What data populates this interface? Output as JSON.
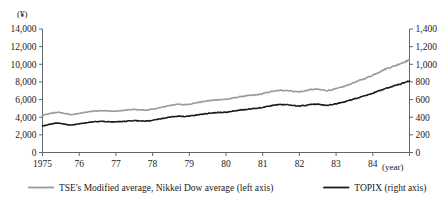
{
  "chart_data": {
    "type": "line",
    "title": "",
    "xlabel": "(year)",
    "ylabel_left": "(¥)",
    "ylabel_right": "",
    "grid": false,
    "legend_position": "bottom",
    "x": [
      1975.0,
      1975.25,
      1975.5,
      1975.75,
      1976.0,
      1976.25,
      1976.5,
      1976.75,
      1977.0,
      1977.25,
      1977.5,
      1977.75,
      1978.0,
      1978.25,
      1978.5,
      1978.75,
      1979.0,
      1979.25,
      1979.5,
      1979.75,
      1980.0,
      1980.25,
      1980.5,
      1980.75,
      1981.0,
      1981.25,
      1981.5,
      1981.75,
      1982.0,
      1982.25,
      1982.5,
      1982.75,
      1983.0,
      1983.25,
      1983.5,
      1983.75,
      1984.0,
      1984.25,
      1984.5,
      1984.75,
      1985.0
    ],
    "xlim": [
      1975.0,
      1985.0
    ],
    "x_ticks": [
      1975,
      1976,
      1977,
      1978,
      1979,
      1980,
      1981,
      1982,
      1983,
      1984,
      1985
    ],
    "x_tick_labels": [
      "1975",
      "76",
      "77",
      "78",
      "79",
      "80",
      "81",
      "82",
      "83",
      "84",
      ""
    ],
    "ylim_left": [
      0,
      14000
    ],
    "y_ticks_left": [
      0,
      2000,
      4000,
      6000,
      8000,
      10000,
      12000,
      14000
    ],
    "y_tick_labels_left": [
      "0",
      "2,000",
      "4,000",
      "6,000",
      "8,000",
      "10,000",
      "12,000",
      "14,000"
    ],
    "ylim_right": [
      0,
      1400
    ],
    "y_ticks_right": [
      0,
      200,
      400,
      600,
      800,
      1000,
      1200,
      1400
    ],
    "y_tick_labels_right": [
      "0",
      "200",
      "400",
      "600",
      "800",
      "1,000",
      "1,200",
      "1,400"
    ],
    "series": [
      {
        "name": "TSE's Modified average, Nikkei Dow average",
        "axis": "left",
        "color": "#9a9a9a",
        "width": 1.6,
        "values": [
          4200,
          4350,
          4500,
          4420,
          4350,
          4600,
          4750,
          4700,
          4650,
          4800,
          4900,
          4820,
          4900,
          5100,
          5300,
          5400,
          5500,
          5700,
          5900,
          6050,
          6100,
          6250,
          6400,
          6500,
          6600,
          6800,
          6950,
          7050,
          6900,
          7100,
          7250,
          7050,
          7200,
          7600,
          8000,
          8350,
          8700,
          9100,
          9500,
          9950,
          10450
        ],
        "raw_points": [
          [
            1975.0,
            4220
          ],
          [
            1975.1,
            4310
          ],
          [
            1975.2,
            4400
          ],
          [
            1975.3,
            4500
          ],
          [
            1975.4,
            4560
          ],
          [
            1975.5,
            4520
          ],
          [
            1975.6,
            4430
          ],
          [
            1975.7,
            4340
          ],
          [
            1975.8,
            4300
          ],
          [
            1975.9,
            4360
          ],
          [
            1976.0,
            4420
          ],
          [
            1976.15,
            4540
          ],
          [
            1976.3,
            4650
          ],
          [
            1976.45,
            4720
          ],
          [
            1976.6,
            4760
          ],
          [
            1976.75,
            4720
          ],
          [
            1976.9,
            4680
          ],
          [
            1977.05,
            4700
          ],
          [
            1977.2,
            4760
          ],
          [
            1977.35,
            4830
          ],
          [
            1977.5,
            4880
          ],
          [
            1977.65,
            4840
          ],
          [
            1977.8,
            4800
          ],
          [
            1977.95,
            4870
          ],
          [
            1978.1,
            4980
          ],
          [
            1978.25,
            5120
          ],
          [
            1978.4,
            5280
          ],
          [
            1978.55,
            5400
          ],
          [
            1978.7,
            5460
          ],
          [
            1978.85,
            5420
          ],
          [
            1979.0,
            5480
          ],
          [
            1979.15,
            5600
          ],
          [
            1979.3,
            5720
          ],
          [
            1979.45,
            5820
          ],
          [
            1979.6,
            5900
          ],
          [
            1979.75,
            5960
          ],
          [
            1979.9,
            6020
          ],
          [
            1980.05,
            6040
          ],
          [
            1980.2,
            6180
          ],
          [
            1980.35,
            6300
          ],
          [
            1980.5,
            6400
          ],
          [
            1980.65,
            6460
          ],
          [
            1980.8,
            6520
          ],
          [
            1980.95,
            6620
          ],
          [
            1981.1,
            6780
          ],
          [
            1981.25,
            6920
          ],
          [
            1981.4,
            7000
          ],
          [
            1981.55,
            7060
          ],
          [
            1981.7,
            7020
          ],
          [
            1981.85,
            6930
          ],
          [
            1982.0,
            6880
          ],
          [
            1982.15,
            6980
          ],
          [
            1982.3,
            7120
          ],
          [
            1982.45,
            7180
          ],
          [
            1982.6,
            7100
          ],
          [
            1982.75,
            7020
          ],
          [
            1982.9,
            7120
          ],
          [
            1983.05,
            7280
          ],
          [
            1983.2,
            7480
          ],
          [
            1983.35,
            7700
          ],
          [
            1983.5,
            7950
          ],
          [
            1983.65,
            8180
          ],
          [
            1983.8,
            8420
          ],
          [
            1983.95,
            8680
          ],
          [
            1984.1,
            8980
          ],
          [
            1984.25,
            9280
          ],
          [
            1984.4,
            9560
          ],
          [
            1984.55,
            9760
          ],
          [
            1984.7,
            10000
          ],
          [
            1984.85,
            10250
          ],
          [
            1985.0,
            10500
          ]
        ]
      },
      {
        "name": "TOPIX",
        "axis": "right",
        "color": "#1a1a1a",
        "width": 1.6,
        "values": [
          300,
          315,
          330,
          322,
          318,
          335,
          348,
          344,
          340,
          352,
          360,
          354,
          362,
          378,
          392,
          402,
          410,
          424,
          438,
          448,
          452,
          464,
          476,
          484,
          492,
          508,
          520,
          528,
          516,
          532,
          544,
          528,
          540,
          572,
          604,
          632,
          660,
          692,
          724,
          760,
          800
        ],
        "raw_points": [
          [
            1975.0,
            300
          ],
          [
            1975.1,
            310
          ],
          [
            1975.2,
            320
          ],
          [
            1975.3,
            328
          ],
          [
            1975.4,
            334
          ],
          [
            1975.5,
            330
          ],
          [
            1975.6,
            322
          ],
          [
            1975.7,
            314
          ],
          [
            1975.8,
            312
          ],
          [
            1975.9,
            318
          ],
          [
            1976.0,
            324
          ],
          [
            1976.15,
            334
          ],
          [
            1976.3,
            344
          ],
          [
            1976.45,
            350
          ],
          [
            1976.6,
            354
          ],
          [
            1976.75,
            350
          ],
          [
            1976.9,
            346
          ],
          [
            1977.05,
            348
          ],
          [
            1977.2,
            352
          ],
          [
            1977.35,
            358
          ],
          [
            1977.5,
            362
          ],
          [
            1977.65,
            358
          ],
          [
            1977.8,
            356
          ],
          [
            1977.95,
            362
          ],
          [
            1978.1,
            372
          ],
          [
            1978.25,
            384
          ],
          [
            1978.4,
            396
          ],
          [
            1978.55,
            406
          ],
          [
            1978.7,
            412
          ],
          [
            1978.85,
            408
          ],
          [
            1979.0,
            412
          ],
          [
            1979.15,
            422
          ],
          [
            1979.3,
            432
          ],
          [
            1979.45,
            440
          ],
          [
            1979.6,
            446
          ],
          [
            1979.75,
            452
          ],
          [
            1979.9,
            456
          ],
          [
            1980.05,
            458
          ],
          [
            1980.2,
            470
          ],
          [
            1980.35,
            480
          ],
          [
            1980.5,
            488
          ],
          [
            1980.65,
            494
          ],
          [
            1980.8,
            500
          ],
          [
            1980.95,
            508
          ],
          [
            1981.1,
            520
          ],
          [
            1981.25,
            532
          ],
          [
            1981.4,
            540
          ],
          [
            1981.55,
            544
          ],
          [
            1981.7,
            540
          ],
          [
            1981.85,
            532
          ],
          [
            1982.0,
            526
          ],
          [
            1982.15,
            534
          ],
          [
            1982.3,
            544
          ],
          [
            1982.45,
            548
          ],
          [
            1982.6,
            542
          ],
          [
            1982.75,
            536
          ],
          [
            1982.9,
            544
          ],
          [
            1983.05,
            556
          ],
          [
            1983.2,
            572
          ],
          [
            1983.35,
            590
          ],
          [
            1983.5,
            608
          ],
          [
            1983.65,
            626
          ],
          [
            1983.8,
            644
          ],
          [
            1983.95,
            664
          ],
          [
            1984.1,
            688
          ],
          [
            1984.25,
            712
          ],
          [
            1984.4,
            734
          ],
          [
            1984.55,
            750
          ],
          [
            1984.7,
            770
          ],
          [
            1984.85,
            790
          ],
          [
            1985.0,
            812
          ]
        ]
      }
    ],
    "legend": [
      {
        "label": "TSE's Modified average, Nikkei Dow average  (left axis)",
        "color": "#9a9a9a"
      },
      {
        "label": "TOPIX (right axis)",
        "color": "#1a1a1a"
      }
    ]
  }
}
